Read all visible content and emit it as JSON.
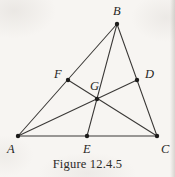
{
  "figure": {
    "caption": "Figure 12.4.5",
    "background_color": "#f7f5f2",
    "stroke_color": "#3a3836",
    "point_color": "#1c1b1a",
    "label_color": "#272624"
  },
  "labels": {
    "A": "A",
    "B": "B",
    "C": "C",
    "D": "D",
    "E": "E",
    "F": "F",
    "G": "G"
  },
  "chart_data": {
    "type": "diagram",
    "title": "Figure 12.4.5",
    "points": [
      {
        "name": "A",
        "x": 18,
        "y": 136,
        "role": "vertex",
        "label_dx": -11,
        "label_dy": 7
      },
      {
        "name": "B",
        "x": 117,
        "y": 24,
        "role": "vertex",
        "label_dx": -4,
        "label_dy": -19
      },
      {
        "name": "C",
        "x": 157,
        "y": 136,
        "role": "vertex",
        "label_dx": 4,
        "label_dy": 7
      },
      {
        "name": "D",
        "x": 137,
        "y": 80,
        "role": "midpoint-of-BC",
        "label_dx": 8,
        "label_dy": -12
      },
      {
        "name": "E",
        "x": 87,
        "y": 136,
        "role": "midpoint-of-AC",
        "label_dx": -4,
        "label_dy": 7
      },
      {
        "name": "F",
        "x": 68,
        "y": 80,
        "role": "midpoint-of-AB",
        "label_dx": -14,
        "label_dy": -12
      },
      {
        "name": "G",
        "x": 97,
        "y": 99,
        "role": "centroid",
        "label_dx": -7,
        "label_dy": -19
      }
    ],
    "segments": [
      {
        "name": "side-AB",
        "from": "A",
        "to": "B"
      },
      {
        "name": "side-BC",
        "from": "B",
        "to": "C"
      },
      {
        "name": "side-AC",
        "from": "A",
        "to": "C"
      },
      {
        "name": "median-AD",
        "from": "A",
        "to": "D"
      },
      {
        "name": "median-BE",
        "from": "B",
        "to": "E"
      },
      {
        "name": "median-CF",
        "from": "C",
        "to": "F"
      }
    ],
    "xlim": [
      0,
      175
    ],
    "ylim": [
      0,
      177
    ],
    "grid": false,
    "legend": null
  }
}
